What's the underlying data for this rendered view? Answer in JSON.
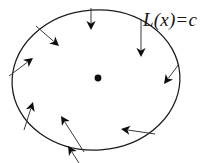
{
  "figure": {
    "background_color": "#ffffff",
    "width": 224,
    "height": 163
  },
  "label": {
    "full_text": "L(x) = c",
    "function_name": "L",
    "open_paren": "(",
    "argument": "x",
    "close_paren": ")",
    "equals": "=",
    "constant": "c",
    "color": "#151515",
    "position": {
      "x": 143,
      "y": 9
    }
  },
  "level_set": {
    "name": "level-set-ellipse",
    "shape": "ellipse",
    "center": {
      "x": 96,
      "y": 80
    },
    "radius_x": 84,
    "radius_y": 70,
    "rotation_deg": -4,
    "stroke_color": "#1b1b1b",
    "stroke_width": 1.25,
    "fill": "none"
  },
  "center_marker": {
    "name": "center-point",
    "x": 98,
    "y": 78,
    "radius": 3.4,
    "color": "#0d0d0d"
  },
  "vectors": {
    "count": 9,
    "shaft_color": "#3a3a3a",
    "head_color": "#0d0d0d",
    "direction_note": "inward",
    "items": [
      {
        "name": "vector-top-left-diagonal",
        "tail": {
          "x": 36,
          "y": 26
        },
        "tip": {
          "x": 59,
          "y": 46
        }
      },
      {
        "name": "vector-top-center-down",
        "tail": {
          "x": 91,
          "y": 8
        },
        "tip": {
          "x": 91,
          "y": 30
        }
      },
      {
        "name": "vector-top-right-down",
        "tail": {
          "x": 141,
          "y": 20
        },
        "tip": {
          "x": 141,
          "y": 57
        }
      },
      {
        "name": "vector-left-upper-inward",
        "tail": {
          "x": 9,
          "y": 76
        },
        "tip": {
          "x": 33,
          "y": 58
        }
      },
      {
        "name": "vector-right-inward",
        "tail": {
          "x": 179,
          "y": 64
        },
        "tip": {
          "x": 164,
          "y": 84
        }
      },
      {
        "name": "vector-left-lower-up",
        "tail": {
          "x": 24,
          "y": 130
        },
        "tip": {
          "x": 33,
          "y": 102
        }
      },
      {
        "name": "vector-bottom-left-up",
        "tail": {
          "x": 84,
          "y": 152
        },
        "tip": {
          "x": 61,
          "y": 116
        }
      },
      {
        "name": "vector-bottom-center-up",
        "tail": {
          "x": 79,
          "y": 163
        },
        "tip": {
          "x": 68,
          "y": 146
        }
      },
      {
        "name": "vector-bottom-right-left",
        "tail": {
          "x": 155,
          "y": 134
        },
        "tip": {
          "x": 121,
          "y": 129
        }
      }
    ]
  }
}
